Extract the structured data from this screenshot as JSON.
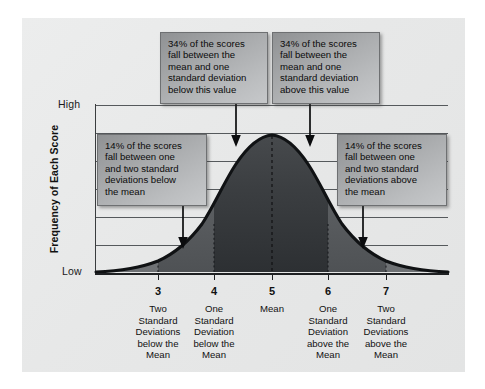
{
  "figure": {
    "type": "normal-distribution-diagram",
    "background_color": "#ffffff",
    "panel_color": "#e9eaea"
  },
  "axes": {
    "y_title": "Frequency of Each Score",
    "y_high_label": "High",
    "y_low_label": "Low",
    "gridline_count": 7
  },
  "x_ticks": [
    {
      "value": "3",
      "caption": "Two\nStandard\nDeviations\nbelow the\nMean",
      "lines": [
        "Two",
        "Standard",
        "Deviations",
        "below the",
        "Mean"
      ]
    },
    {
      "value": "4",
      "caption": "One\nStandard\nDeviation\nbelow the\nMean",
      "lines": [
        "One",
        "Standard",
        "Deviation",
        "below the",
        "Mean"
      ]
    },
    {
      "value": "5",
      "caption": "Mean",
      "lines": [
        "Mean"
      ]
    },
    {
      "value": "6",
      "caption": "One\nStandard\nDeviation\nabove the\nMean",
      "lines": [
        "One",
        "Standard",
        "Deviation",
        "above the",
        "Mean"
      ]
    },
    {
      "value": "7",
      "caption": "Two\nStandard\nDeviations\nabove the\nMean",
      "lines": [
        "Two",
        "Standard",
        "Deviations",
        "above the",
        "Mean"
      ]
    }
  ],
  "callouts": [
    {
      "id": "pct-34-below",
      "percent": "34%",
      "lines": [
        "34% of the scores",
        "fall between the",
        "mean and one",
        "standard deviation",
        "below this value"
      ]
    },
    {
      "id": "pct-34-above",
      "percent": "34%",
      "lines": [
        "34% of the scores",
        "fall between the",
        "mean and one",
        "standard deviation",
        "above this value"
      ]
    },
    {
      "id": "pct-14-below",
      "percent": "14%",
      "lines": [
        "14% of the scores",
        "fall between one",
        "and two standard",
        "deviations below",
        "the mean"
      ]
    },
    {
      "id": "pct-14-above",
      "percent": "14%",
      "lines": [
        "14% of the scores",
        "fall between one",
        "and two standard",
        "deviations above",
        "the mean"
      ]
    }
  ],
  "chart_data": {
    "type": "line",
    "title": "",
    "xlabel": "",
    "ylabel": "Frequency of Each Score",
    "curve": "normal",
    "mean": 5,
    "sd": 1,
    "x_tick_values": [
      3,
      4,
      5,
      6,
      7
    ],
    "x_tick_labels": [
      "3",
      "4",
      "5",
      "6",
      "7"
    ],
    "y_tick_labels": [
      "Low",
      "High"
    ],
    "ylim": [
      0,
      1
    ],
    "xlim": [
      2.3,
      7.7
    ],
    "grid": true,
    "legend": "none",
    "annotations": [
      {
        "region": "mean to -1 SD",
        "percent": 34
      },
      {
        "region": "mean to +1 SD",
        "percent": 34
      },
      {
        "region": "-1 SD to -2 SD",
        "percent": 14
      },
      {
        "region": "+1 SD to +2 SD",
        "percent": 14
      }
    ],
    "series": [
      {
        "name": "normal curve",
        "x": [
          2.3,
          2.5,
          2.7,
          2.9,
          3.0,
          3.2,
          3.4,
          3.6,
          3.8,
          4.0,
          4.2,
          4.4,
          4.6,
          4.8,
          5.0,
          5.2,
          5.4,
          5.6,
          5.8,
          6.0,
          6.2,
          6.4,
          6.6,
          6.8,
          7.0,
          7.2,
          7.4,
          7.6,
          7.7
        ],
        "y": [
          0.004,
          0.009,
          0.018,
          0.036,
          0.049,
          0.086,
          0.141,
          0.217,
          0.316,
          0.432,
          0.556,
          0.677,
          0.782,
          0.861,
          0.909,
          0.861,
          0.782,
          0.677,
          0.556,
          0.432,
          0.316,
          0.217,
          0.141,
          0.086,
          0.049,
          0.027,
          0.014,
          0.007,
          0.004
        ]
      }
    ]
  }
}
